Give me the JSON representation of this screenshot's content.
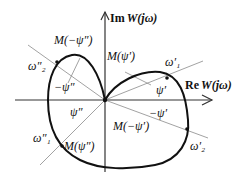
{
  "diagram": {
    "type": "complex-plane-frequency-response",
    "axes": {
      "imag_label_prefix": "Im",
      "imag_label_func": "W(jω)",
      "real_label_prefix": "Re",
      "real_label_func": "W(jω)"
    },
    "points": {
      "w1_prime": "ω′₁",
      "w2_prime": "ω′₂",
      "w1_dprime": "ω″₁",
      "w2_dprime": "ω″₂"
    },
    "angles": {
      "psi_prime": "ψ′",
      "neg_psi_prime": "−ψ′",
      "psi_dprime": "ψ″",
      "neg_psi_dprime": "−ψ″"
    },
    "magnitudes": {
      "m_psi_prime": "M(ψ′)",
      "m_neg_psi_prime": "M(−ψ′)",
      "m_psi_dprime": "M(ψ″)",
      "m_neg_psi_dprime": "M(−ψ″)"
    },
    "colors": {
      "curve": "#111111",
      "axis": "#333333",
      "ray": "#888888"
    }
  }
}
